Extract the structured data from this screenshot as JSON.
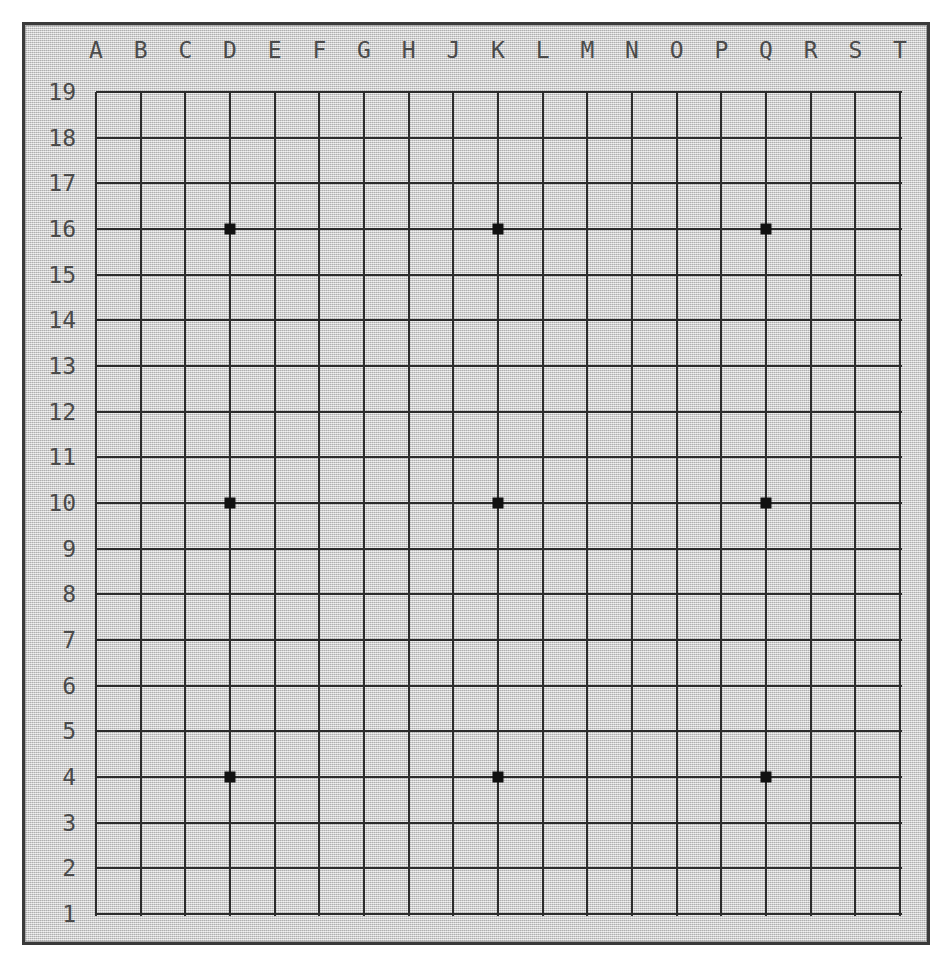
{
  "board": {
    "kind": "go-board",
    "size": 19,
    "background_color": "#c9c9c9",
    "line_color": "#2b2b2b",
    "border_color": "#3a3a3a",
    "label_color": "#4a4a4a",
    "star_point_color": "#111111",
    "column_labels": [
      "A",
      "B",
      "C",
      "D",
      "E",
      "F",
      "G",
      "H",
      "J",
      "K",
      "L",
      "M",
      "N",
      "O",
      "P",
      "Q",
      "R",
      "S",
      "T"
    ],
    "row_labels": [
      "19",
      "18",
      "17",
      "16",
      "15",
      "14",
      "13",
      "12",
      "11",
      "10",
      "9",
      "8",
      "7",
      "6",
      "5",
      "4",
      "3",
      "2",
      "1"
    ],
    "star_points": [
      {
        "label": "D16",
        "col": "D",
        "row": "16"
      },
      {
        "label": "K16",
        "col": "K",
        "row": "16"
      },
      {
        "label": "Q16",
        "col": "Q",
        "row": "16"
      },
      {
        "label": "D10",
        "col": "D",
        "row": "10"
      },
      {
        "label": "K10",
        "col": "K",
        "row": "10"
      },
      {
        "label": "Q10",
        "col": "Q",
        "row": "10"
      },
      {
        "label": "D4",
        "col": "D",
        "row": "4"
      },
      {
        "label": "K4",
        "col": "K",
        "row": "4"
      },
      {
        "label": "Q4",
        "col": "Q",
        "row": "4"
      }
    ],
    "stones": [],
    "geometry": {
      "grid_left": 93,
      "grid_top": 89,
      "grid_right": 897,
      "grid_bottom": 911,
      "col_spacing": 44.67,
      "row_spacing": 45.67,
      "col_label_y": 47,
      "row_label_right_x": 73
    }
  }
}
